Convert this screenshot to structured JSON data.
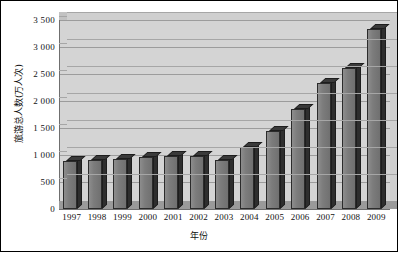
{
  "chart_data": {
    "type": "bar",
    "title": "",
    "xlabel": "年份",
    "ylabel": "旅游总人数(万人次)",
    "categories": [
      "1997",
      "1998",
      "1999",
      "2000",
      "2001",
      "2002",
      "2003",
      "2004",
      "2005",
      "2006",
      "2007",
      "2008",
      "2009"
    ],
    "values": [
      880,
      900,
      930,
      970,
      980,
      980,
      900,
      1150,
      1450,
      1850,
      2330,
      2620,
      3330
    ],
    "series": [
      {
        "name": "旅游总人数(万人次)",
        "values": [
          880,
          900,
          930,
          970,
          980,
          980,
          900,
          1150,
          1450,
          1850,
          2330,
          2620,
          3330
        ]
      }
    ],
    "ylim": [
      0,
      3500
    ],
    "ytick_labels": [
      "3 500",
      "3 000",
      "2 500",
      "2 000",
      "1 500",
      "1 000",
      "500",
      "0"
    ],
    "ytick_values": [
      3500,
      3000,
      2500,
      2000,
      1500,
      1000,
      500,
      0
    ],
    "ytick_step": 500,
    "grid": true,
    "legend": false,
    "legend_position": "none",
    "style": "3d-column",
    "colors": {
      "bar": "#7c7c7c",
      "bar_edge": "#2b2b2b",
      "plot_background": "#d4d4d4",
      "gridline": "#9c9c9c",
      "floor": "#9a9a9a",
      "frame_border": "#000000",
      "text": "#111111"
    }
  }
}
